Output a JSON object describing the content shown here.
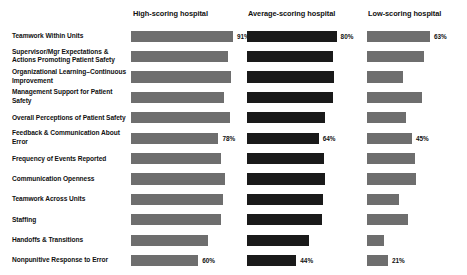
{
  "chart_data": {
    "type": "bar",
    "title": "",
    "xlabel": "",
    "ylabel": "",
    "xlim": [
      0,
      100
    ],
    "grid": false,
    "legend_position": "top",
    "orientation": "horizontal",
    "categories": [
      "Teamwork Within Units",
      "Supervisor/Mgr Expectations & Actions Promoting Patient Safety",
      "Organizational Learning–Continuous Improvement",
      "Management Support for Patient Safety",
      "Overall Perceptions of Patient Safety",
      "Feedback & Communication About Error",
      "Frequency of Events Reported",
      "Communication Openness",
      "Teamwork Across Units",
      "Staffing",
      "Handoffs & Transitions",
      "Nonpunitive Response to Error"
    ],
    "series": [
      {
        "name": "High-scoring hospital",
        "color": "#6e6e6e",
        "values": [
          91,
          87,
          89,
          83,
          88,
          78,
          80,
          84,
          82,
          80,
          69,
          60
        ],
        "labels": [
          "91%",
          "",
          "",
          "",
          "",
          "78%",
          "",
          "",
          "",
          "",
          "",
          "60%"
        ]
      },
      {
        "name": "Average-scoring hospital",
        "color": "#1a1a1a",
        "values": [
          80,
          77,
          78,
          77,
          70,
          64,
          69,
          70,
          68,
          67,
          55,
          44
        ],
        "labels": [
          "80%",
          "",
          "",
          "",
          "",
          "64%",
          "",
          "",
          "",
          "",
          "",
          "44%"
        ]
      },
      {
        "name": "Low-scoring hospital",
        "color": "#6e6e6e",
        "values": [
          63,
          57,
          36,
          55,
          39,
          45,
          48,
          49,
          32,
          41,
          17,
          21
        ],
        "labels": [
          "63%",
          "",
          "",
          "",
          "",
          "45%",
          "",
          "",
          "",
          "",
          "",
          "21%"
        ]
      }
    ]
  },
  "headers": [
    "High-scoring hospital",
    "Average-scoring hospital",
    "Low-scoring hospital"
  ]
}
